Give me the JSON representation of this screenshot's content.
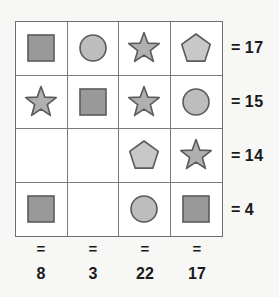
{
  "puzzle": {
    "title": "Shape sum grid puzzle",
    "grid": {
      "rows": 4,
      "cols": 4,
      "cells": [
        [
          {
            "shape": "square",
            "name": "square-shape"
          },
          {
            "shape": "circle",
            "name": "circle-shape"
          },
          {
            "shape": "star",
            "name": "star-shape"
          },
          {
            "shape": "pentagon",
            "name": "pentagon-shape"
          }
        ],
        [
          {
            "shape": "star",
            "name": "star-shape"
          },
          {
            "shape": "square",
            "name": "square-shape"
          },
          {
            "shape": "star",
            "name": "star-shape"
          },
          {
            "shape": "circle",
            "name": "circle-shape"
          }
        ],
        [
          {
            "shape": "empty",
            "name": "empty-cell"
          },
          {
            "shape": "empty",
            "name": "empty-cell"
          },
          {
            "shape": "pentagon",
            "name": "pentagon-shape"
          },
          {
            "shape": "star",
            "name": "star-shape"
          }
        ],
        [
          {
            "shape": "square",
            "name": "square-shape"
          },
          {
            "shape": "empty",
            "name": "empty-cell"
          },
          {
            "shape": "circle",
            "name": "circle-shape"
          },
          {
            "shape": "square",
            "name": "square-shape"
          }
        ]
      ]
    },
    "equals_symbol": "=",
    "row_sums": [
      "17",
      "15",
      "14",
      "4"
    ],
    "col_sums": [
      "8",
      "3",
      "22",
      "17"
    ],
    "colors": {
      "square_fill": "#999999",
      "square_stroke": "#5a5a5a",
      "circle_fill": "#bdbdbd",
      "circle_stroke": "#5a5a5a",
      "star_fill": "#b0b0b0",
      "star_stroke": "#5a5a5a",
      "pentagon_fill": "#c8c8c8",
      "pentagon_stroke": "#5a5a5a",
      "grid_line": "#7a7a7a",
      "grid_border": "#6e6e6e",
      "cell_background": "#ffffff",
      "page_background": "#f7f7f5",
      "text": "#1a1a1a"
    }
  }
}
